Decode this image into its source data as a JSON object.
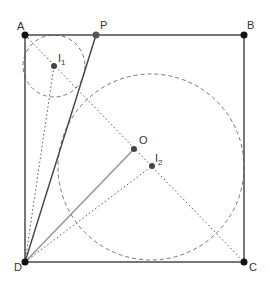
{
  "diagram": {
    "points": {
      "A": {
        "label": "A",
        "x": 25,
        "y": 35
      },
      "P": {
        "label": "P",
        "x": 96,
        "y": 35
      },
      "B": {
        "label": "B",
        "x": 244,
        "y": 35
      },
      "C": {
        "label": "C",
        "x": 244,
        "y": 262
      },
      "D": {
        "label": "D",
        "x": 25,
        "y": 262
      },
      "I1": {
        "label": "I",
        "sub": "1",
        "x": 54,
        "y": 66
      },
      "O": {
        "label": "O",
        "x": 134,
        "y": 149
      },
      "I2": {
        "label": "I",
        "sub": "2",
        "x": 152,
        "y": 166
      }
    },
    "colors": {
      "line": "#555555",
      "point": "#111111",
      "inner_point": "#444444",
      "dash": "#777777"
    }
  }
}
